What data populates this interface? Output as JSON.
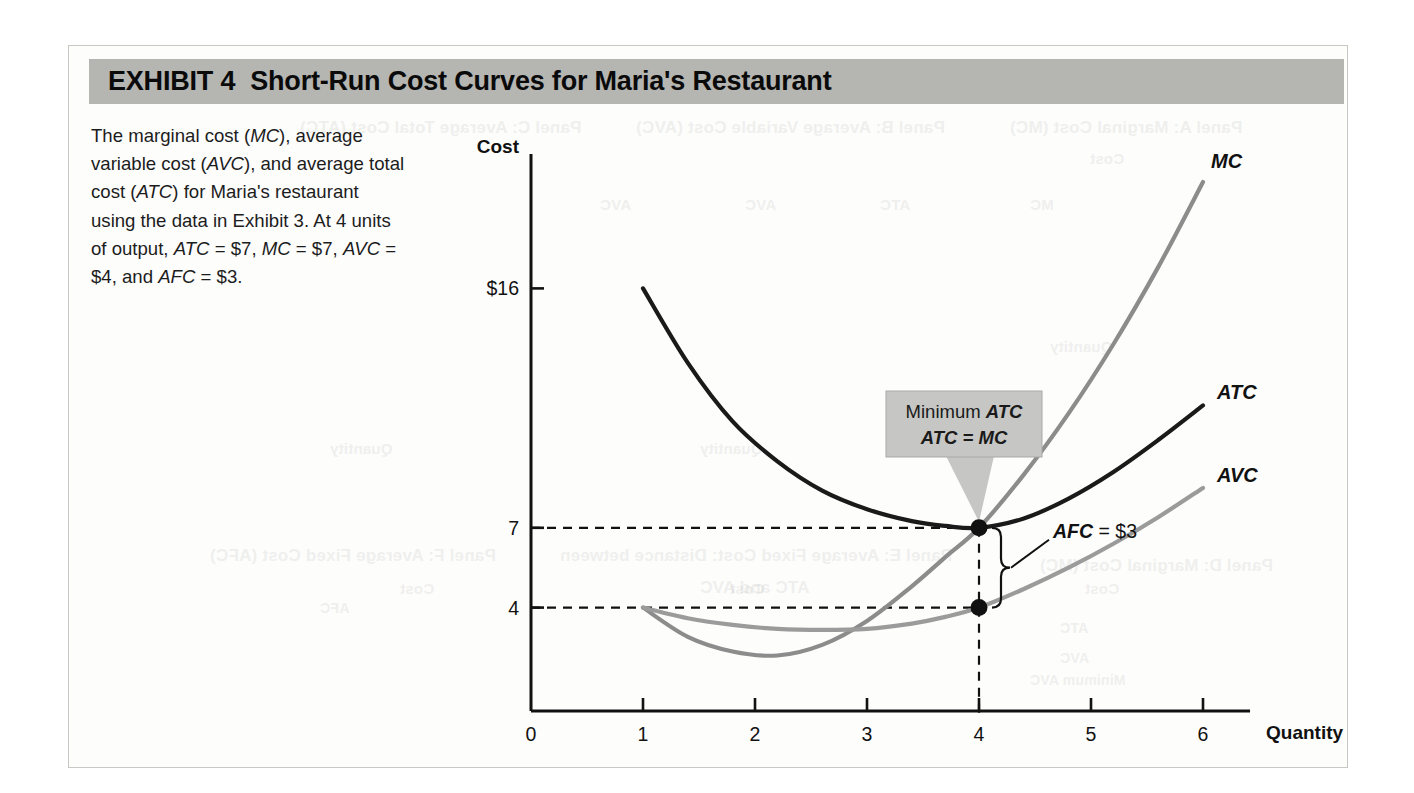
{
  "exhibit": {
    "label": "EXHIBIT 4",
    "title": "Short-Run Cost Curves for Maria's Restaurant",
    "header_bg": "#b5b5b2"
  },
  "caption": {
    "segments": [
      {
        "t": "The marginal cost ("
      },
      {
        "t": "MC",
        "i": true
      },
      {
        "t": "), average variable cost ("
      },
      {
        "t": "AVC",
        "i": true
      },
      {
        "t": "), and average total cost ("
      },
      {
        "t": "ATC",
        "i": true
      },
      {
        "t": ") for Maria's restaurant using the data in Exhibit 3. At 4 units of output, "
      },
      {
        "t": "ATC",
        "i": true
      },
      {
        "t": " = $7, "
      },
      {
        "t": "MC",
        "i": true
      },
      {
        "t": " = $7, "
      },
      {
        "t": "AVC",
        "i": true
      },
      {
        "t": " = $4, and "
      },
      {
        "t": "AFC",
        "i": true
      },
      {
        "t": " = $3."
      }
    ],
    "plain": "The marginal cost (MC), average variable cost (AVC), and average total cost (ATC) for Maria's restaurant using the data in Exhibit 3. At 4 units of output, ATC = $7, MC = $7, AVC = $4, and AFC = $3."
  },
  "chart_data": {
    "type": "line",
    "title": "Short-Run Cost Curves for Maria's Restaurant",
    "xlabel": "Quantity",
    "ylabel": "Cost",
    "xlim": [
      0,
      6.35
    ],
    "ylim": [
      0,
      21
    ],
    "xticks": [
      "0",
      "1",
      "2",
      "3",
      "4",
      "5",
      "6"
    ],
    "xtick_values": [
      0,
      1,
      2,
      3,
      4,
      5,
      6
    ],
    "yticks": [
      "4",
      "7",
      "$16"
    ],
    "ytick_values": [
      4,
      7,
      16
    ],
    "grid": false,
    "legend": "curve-end labels",
    "series": [
      {
        "name": "MC",
        "color": "#8c8c8c",
        "label": "MC",
        "x": [
          1,
          1.4,
          1.8,
          2.2,
          2.6,
          3.0,
          3.4,
          3.7,
          4.0,
          4.4,
          4.8,
          5.2,
          5.6,
          6.0
        ],
        "y": [
          4.0,
          2.9,
          2.35,
          2.2,
          2.6,
          3.5,
          4.8,
          5.9,
          7.0,
          9.0,
          11.3,
          13.9,
          16.8,
          20.0
        ]
      },
      {
        "name": "ATC",
        "color": "#1a1a1a",
        "label": "ATC",
        "x": [
          1,
          1.4,
          1.8,
          2.2,
          2.6,
          3.0,
          3.4,
          3.7,
          4.0,
          4.4,
          4.8,
          5.2,
          5.6,
          6.0
        ],
        "y": [
          16.0,
          13.2,
          11.0,
          9.5,
          8.4,
          7.7,
          7.25,
          7.07,
          7.0,
          7.35,
          8.1,
          9.1,
          10.3,
          11.6
        ]
      },
      {
        "name": "AVC",
        "color": "#9b9b9b",
        "label": "AVC",
        "x": [
          1,
          1.4,
          1.8,
          2.2,
          2.6,
          3.0,
          3.4,
          3.7,
          4.0,
          4.4,
          4.8,
          5.2,
          5.6,
          6.0
        ],
        "y": [
          4.0,
          3.6,
          3.35,
          3.2,
          3.16,
          3.2,
          3.4,
          3.65,
          4.0,
          4.7,
          5.5,
          6.4,
          7.4,
          8.5
        ]
      }
    ],
    "annotations": [
      {
        "name": "minimum-atc-callout",
        "lines": [
          [
            {
              "t": "Minimum ",
              "i": false
            },
            {
              "t": "ATC",
              "i": true
            }
          ],
          [
            {
              "t": "ATC = MC",
              "i": true
            }
          ]
        ],
        "plain": "Minimum ATC ATC = MC",
        "points_to": [
          4,
          7
        ],
        "bg": "#c6c6c4"
      },
      {
        "name": "afc-annotation",
        "segments": [
          {
            "t": "AFC",
            "i": true
          },
          {
            "t": " = $3",
            "i": false
          }
        ],
        "plain": "AFC = $3",
        "spans": [
          4,
          4,
          7
        ]
      }
    ],
    "markers": [
      {
        "x": 4,
        "y": 7,
        "label": "ATC = MC = $7"
      },
      {
        "x": 4,
        "y": 4,
        "label": "AVC = $4"
      }
    ],
    "guide_lines": [
      {
        "type": "horizontal",
        "value": 7,
        "from_x": 0,
        "to_x": 4,
        "style": "dashed"
      },
      {
        "type": "horizontal",
        "value": 4,
        "from_x": 0,
        "to_x": 4,
        "style": "dashed"
      },
      {
        "type": "vertical",
        "value": 4,
        "from_y": 0,
        "to_y": 7,
        "style": "dashed"
      }
    ]
  },
  "ghost_text": [
    {
      "t": "Panel A: Marginal Cost (MC)",
      "x": 1010,
      "y": 118,
      "size": 17
    },
    {
      "t": "Panel B: Average Variable Cost (AVC)",
      "x": 636,
      "y": 118,
      "size": 17
    },
    {
      "t": "Panel C: Average Total Cost (ATC)",
      "x": 300,
      "y": 118,
      "size": 17
    },
    {
      "t": "Cost",
      "x": 1090,
      "y": 150,
      "size": 15
    },
    {
      "t": "MC",
      "x": 1030,
      "y": 196,
      "size": 15
    },
    {
      "t": "ATC",
      "x": 880,
      "y": 196,
      "size": 15
    },
    {
      "t": "AVC",
      "x": 745,
      "y": 196,
      "size": 15
    },
    {
      "t": "AVC",
      "x": 600,
      "y": 196,
      "size": 15
    },
    {
      "t": "Quantity",
      "x": 1050,
      "y": 338,
      "size": 15
    },
    {
      "t": "Quantity",
      "x": 700,
      "y": 440,
      "size": 15
    },
    {
      "t": "Quantity",
      "x": 330,
      "y": 440,
      "size": 15
    },
    {
      "t": "Panel D: Marginal Cost (MC)",
      "x": 1040,
      "y": 556,
      "size": 17
    },
    {
      "t": "Panel E: Average Fixed Cost: Distance between",
      "x": 560,
      "y": 546,
      "size": 17
    },
    {
      "t": "ATC and AVC",
      "x": 700,
      "y": 578,
      "size": 17
    },
    {
      "t": "Panel F: Average Fixed Cost (AFC)",
      "x": 210,
      "y": 546,
      "size": 17
    },
    {
      "t": "Cost",
      "x": 1085,
      "y": 580,
      "size": 15
    },
    {
      "t": "Cost",
      "x": 730,
      "y": 580,
      "size": 15
    },
    {
      "t": "Cost",
      "x": 400,
      "y": 580,
      "size": 15
    },
    {
      "t": "ATC",
      "x": 1060,
      "y": 620,
      "size": 14
    },
    {
      "t": "AVC",
      "x": 1060,
      "y": 650,
      "size": 14
    },
    {
      "t": "Minimum AVC",
      "x": 1030,
      "y": 672,
      "size": 14
    },
    {
      "t": "AFC",
      "x": 320,
      "y": 600,
      "size": 14
    }
  ]
}
